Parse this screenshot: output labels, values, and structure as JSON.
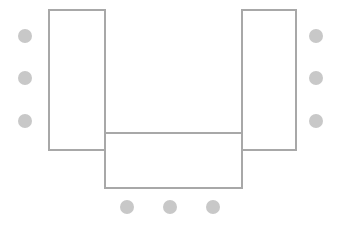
{
  "diagram": {
    "canvas": {
      "width": 337,
      "height": 227,
      "background": "#ffffff"
    },
    "style": {
      "table_stroke_color": "#a8a8a8",
      "table_fill_color": "#ffffff",
      "table_stroke_width": 2,
      "seat_fill_color": "#c8c8c8",
      "seat_radius": 7
    },
    "tables": [
      {
        "name": "left-table",
        "label": "Left Wing Table",
        "x": 49,
        "y": 10,
        "width": 56,
        "height": 140
      },
      {
        "name": "right-table",
        "label": "Right Wing Table",
        "x": 242,
        "y": 10,
        "width": 54,
        "height": 140
      },
      {
        "name": "bottom-table",
        "label": "Head Table",
        "x": 105,
        "y": 133,
        "width": 137,
        "height": 55
      }
    ],
    "seat_groups": [
      {
        "name": "left-seats",
        "label": "Left Side Seats",
        "count": 3,
        "seats": [
          {
            "name": "seat-left-1",
            "cx": 25,
            "cy": 36,
            "r": 7
          },
          {
            "name": "seat-left-2",
            "cx": 25,
            "cy": 78,
            "r": 7
          },
          {
            "name": "seat-left-3",
            "cx": 25,
            "cy": 121,
            "r": 7
          }
        ]
      },
      {
        "name": "right-seats",
        "label": "Right Side Seats",
        "count": 3,
        "seats": [
          {
            "name": "seat-right-1",
            "cx": 316,
            "cy": 36,
            "r": 7
          },
          {
            "name": "seat-right-2",
            "cx": 316,
            "cy": 78,
            "r": 7
          },
          {
            "name": "seat-right-3",
            "cx": 316,
            "cy": 121,
            "r": 7
          }
        ]
      },
      {
        "name": "bottom-seats",
        "label": "Bottom Side Seats",
        "count": 3,
        "seats": [
          {
            "name": "seat-bottom-1",
            "cx": 127,
            "cy": 207,
            "r": 7
          },
          {
            "name": "seat-bottom-2",
            "cx": 170,
            "cy": 207,
            "r": 7
          },
          {
            "name": "seat-bottom-3",
            "cx": 213,
            "cy": 207,
            "r": 7
          }
        ]
      }
    ],
    "total_seats": 9
  }
}
